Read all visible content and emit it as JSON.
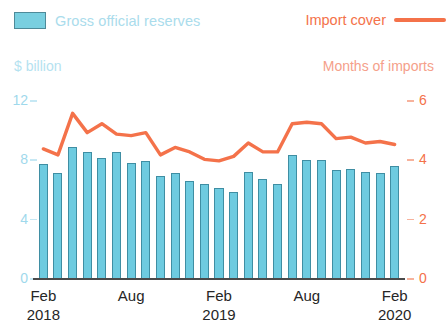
{
  "legend": {
    "bars_label": "Gross official reserves",
    "line_label": "Import cover",
    "bar_color": "#6ecbe0",
    "line_color": "#f4724a"
  },
  "axes": {
    "left_title": "$ billion",
    "right_title": "Months of imports",
    "left_ticks": [
      "12",
      "8",
      "4",
      "0"
    ],
    "right_ticks": [
      "6",
      "4",
      "2",
      "0"
    ],
    "left_range": [
      0,
      12
    ],
    "right_range": [
      0,
      6
    ]
  },
  "xaxis": {
    "labels": [
      {
        "month": "Feb",
        "year": "2018"
      },
      {
        "month": "Aug",
        "year": ""
      },
      {
        "month": "Feb",
        "year": "2019"
      },
      {
        "month": "Aug",
        "year": ""
      },
      {
        "month": "Feb",
        "year": "2020"
      }
    ]
  },
  "chart_data": {
    "type": "bar",
    "title": "",
    "subtitle": "",
    "xlabel": "",
    "ylabel": "$ billion",
    "y2label": "Months of imports",
    "ylim": [
      0,
      12
    ],
    "y2lim": [
      0,
      6
    ],
    "grid": false,
    "legend_position": "top",
    "categories": [
      "Feb 2018",
      "Mar 2018",
      "Apr 2018",
      "May 2018",
      "Jun 2018",
      "Jul 2018",
      "Aug 2018",
      "Sep 2018",
      "Oct 2018",
      "Nov 2018",
      "Dec 2018",
      "Jan 2019",
      "Feb 2019",
      "Mar 2019",
      "Apr 2019",
      "May 2019",
      "Jun 2019",
      "Jul 2019",
      "Aug 2019",
      "Sep 2019",
      "Oct 2019",
      "Nov 2019",
      "Dec 2019",
      "Jan 2020",
      "Feb 2020"
    ],
    "series": [
      {
        "name": "Gross official reserves",
        "type": "bar",
        "axis": "left",
        "unit": "$ billion",
        "color": "#6ecbe0",
        "values": [
          7.8,
          7.2,
          9.0,
          8.6,
          8.2,
          8.6,
          7.9,
          8.0,
          7.0,
          7.2,
          6.7,
          6.5,
          6.2,
          5.9,
          7.3,
          6.8,
          6.5,
          8.4,
          8.1,
          8.1,
          7.4,
          7.5,
          7.3,
          7.2,
          7.7
        ]
      },
      {
        "name": "Import cover",
        "type": "line",
        "axis": "right",
        "unit": "Months of imports",
        "color": "#f4724a",
        "values": [
          4.35,
          4.15,
          5.55,
          4.9,
          5.2,
          4.85,
          4.8,
          4.9,
          4.15,
          4.4,
          4.25,
          4.0,
          3.95,
          4.1,
          4.55,
          4.25,
          4.25,
          5.2,
          5.25,
          5.2,
          4.7,
          4.75,
          4.55,
          4.6,
          4.5
        ]
      }
    ]
  }
}
